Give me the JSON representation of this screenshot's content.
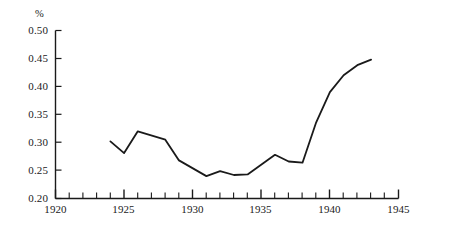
{
  "chart_data": {
    "type": "line",
    "title": "",
    "subtitle": "",
    "xlabel": "",
    "ylabel": "",
    "unit_label": "%",
    "grid": false,
    "legend": null,
    "xlim": [
      1920,
      1945
    ],
    "ylim": [
      0.2,
      0.5
    ],
    "x_major_ticks": [
      1920,
      1925,
      1930,
      1935,
      1940,
      1945
    ],
    "x_major_tick_labels": [
      "1920",
      "1925",
      "1930",
      "1935",
      "1940",
      "1945"
    ],
    "x_minor_tick_interval": 1,
    "y_ticks": [
      0.2,
      0.25,
      0.3,
      0.35,
      0.4,
      0.45,
      0.5
    ],
    "y_tick_labels": [
      "0.20",
      "0.25",
      "0.30",
      "0.35",
      "0.40",
      "0.45",
      "0.50"
    ],
    "series": [
      {
        "name": "",
        "color": "#1a1a1a",
        "x": [
          1924,
          1925,
          1926,
          1928,
          1929,
          1931,
          1932,
          1933,
          1934,
          1936,
          1937,
          1938,
          1939,
          1940,
          1941,
          1942,
          1943
        ],
        "values": [
          0.302,
          0.281,
          0.32,
          0.305,
          0.268,
          0.24,
          0.249,
          0.242,
          0.243,
          0.278,
          0.266,
          0.264,
          0.336,
          0.39,
          0.42,
          0.438,
          0.448
        ]
      }
    ]
  },
  "axis": {
    "unit_label": "%"
  }
}
